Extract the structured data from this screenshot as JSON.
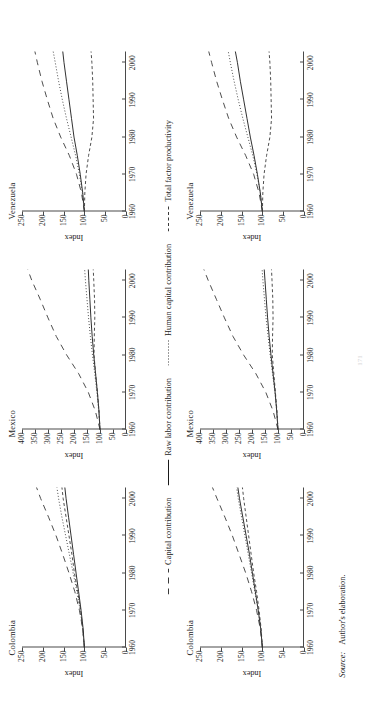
{
  "figure": {
    "ylabel": "Index",
    "source_label": "Source:",
    "source_text": "Author's elaboration.",
    "folio": "171",
    "legend": [
      {
        "label": "Capital contribution",
        "style": "long-dash",
        "color": "#3a3a3a"
      },
      {
        "label": "Raw labor contribution",
        "style": "solid",
        "color": "#1a1a1a"
      },
      {
        "label": "Human capital contribution",
        "style": "dotted",
        "color": "#3a3a3a"
      },
      {
        "label": "Total factor productivity",
        "style": "short-dash",
        "color": "#3a3a3a"
      }
    ]
  },
  "chart_data": [
    {
      "id": "colombia-top",
      "type": "line",
      "title": "Colombia",
      "xlabel": "",
      "ylabel": "Index",
      "xlim": [
        1960,
        2003
      ],
      "ylim": [
        0,
        250
      ],
      "xticks": [
        1960,
        1970,
        1980,
        1990,
        2000
      ],
      "yticks": [
        0,
        50,
        100,
        150,
        200,
        250
      ],
      "grid": false,
      "legend_position": "below-figure",
      "x": [
        1960,
        1965,
        1970,
        1975,
        1980,
        1985,
        1990,
        1995,
        2000,
        2003
      ],
      "series": [
        {
          "name": "Capital contribution",
          "style": "long-dash",
          "values": [
            100,
            104,
            112,
            123,
            137,
            152,
            168,
            186,
            205,
            215
          ]
        },
        {
          "name": "Raw labor contribution",
          "style": "solid",
          "values": [
            100,
            103,
            108,
            114,
            120,
            126,
            132,
            138,
            144,
            147
          ]
        },
        {
          "name": "Human capital contribution",
          "style": "dotted",
          "values": [
            100,
            104,
            110,
            118,
            127,
            136,
            145,
            154,
            162,
            166
          ]
        },
        {
          "name": "Total factor productivity",
          "style": "short-dash",
          "values": [
            100,
            104,
            109,
            116,
            124,
            130,
            137,
            144,
            151,
            154
          ]
        }
      ]
    },
    {
      "id": "mexico-top",
      "type": "line",
      "title": "Mexico",
      "xlabel": "",
      "ylabel": "Index",
      "xlim": [
        1960,
        2003
      ],
      "ylim": [
        0,
        400
      ],
      "xticks": [
        1960,
        1970,
        1980,
        1990,
        2000
      ],
      "yticks": [
        0,
        50,
        100,
        150,
        200,
        250,
        300,
        350,
        400
      ],
      "grid": false,
      "legend_position": "below-figure",
      "x": [
        1960,
        1965,
        1970,
        1975,
        1980,
        1985,
        1990,
        1995,
        2000,
        2003
      ],
      "series": [
        {
          "name": "Capital contribution",
          "style": "long-dash",
          "values": [
            100,
            118,
            145,
            182,
            228,
            268,
            300,
            330,
            362,
            378
          ]
        },
        {
          "name": "Raw labor contribution",
          "style": "solid",
          "values": [
            100,
            104,
            110,
            117,
            124,
            130,
            135,
            139,
            143,
            145
          ]
        },
        {
          "name": "Human capital contribution",
          "style": "dotted",
          "values": [
            100,
            105,
            112,
            120,
            129,
            137,
            144,
            150,
            156,
            159
          ]
        },
        {
          "name": "Total factor productivity",
          "style": "short-dash",
          "values": [
            100,
            104,
            110,
            117,
            123,
            122,
            120,
            121,
            124,
            126
          ]
        }
      ]
    },
    {
      "id": "venezuela-top",
      "type": "line",
      "title": "Venezuela",
      "xlabel": "",
      "ylabel": "Index",
      "xlim": [
        1960,
        2003
      ],
      "ylim": [
        0,
        250
      ],
      "xticks": [
        1960,
        1970,
        1980,
        1990,
        2000
      ],
      "yticks": [
        0,
        50,
        100,
        150,
        200,
        250
      ],
      "grid": false,
      "legend_position": "below-figure",
      "x": [
        1960,
        1965,
        1970,
        1975,
        1980,
        1985,
        1990,
        1995,
        2000,
        2003
      ],
      "series": [
        {
          "name": "Capital contribution",
          "style": "long-dash",
          "values": [
            100,
            107,
            119,
            136,
            157,
            175,
            189,
            202,
            213,
            219
          ]
        },
        {
          "name": "Raw labor contribution",
          "style": "solid",
          "values": [
            100,
            104,
            110,
            117,
            125,
            131,
            137,
            143,
            149,
            152
          ]
        },
        {
          "name": "Human capital contribution",
          "style": "dotted",
          "values": [
            100,
            105,
            112,
            121,
            132,
            143,
            153,
            162,
            170,
            175
          ]
        },
        {
          "name": "Total factor productivity",
          "style": "short-dash",
          "values": [
            100,
            99,
            96,
            90,
            82,
            78,
            79,
            80,
            82,
            84
          ]
        }
      ]
    },
    {
      "id": "colombia-bottom",
      "type": "line",
      "title": "Colombia",
      "xlabel": "",
      "ylabel": "Index",
      "xlim": [
        1960,
        2003
      ],
      "ylim": [
        0,
        250
      ],
      "xticks": [
        1960,
        1970,
        1980,
        1990,
        2000
      ],
      "yticks": [
        0,
        50,
        100,
        150,
        200,
        250
      ],
      "grid": false,
      "legend_position": "above-figure",
      "x": [
        1960,
        1965,
        1970,
        1975,
        1980,
        1985,
        1990,
        1995,
        2000,
        2003
      ],
      "series": [
        {
          "name": "Capital contribution",
          "style": "long-dash",
          "values": [
            100,
            105,
            114,
            126,
            140,
            156,
            172,
            190,
            209,
            220
          ]
        },
        {
          "name": "Raw labor contribution",
          "style": "solid",
          "values": [
            100,
            104,
            110,
            117,
            124,
            131,
            139,
            147,
            155,
            159
          ]
        },
        {
          "name": "Human capital contribution",
          "style": "dotted",
          "values": [
            100,
            104,
            110,
            118,
            126,
            134,
            142,
            150,
            158,
            162
          ]
        },
        {
          "name": "Total factor productivity",
          "style": "short-dash",
          "values": [
            100,
            103,
            108,
            114,
            121,
            127,
            133,
            139,
            145,
            148
          ]
        }
      ]
    },
    {
      "id": "mexico-bottom",
      "type": "line",
      "title": "Mexico",
      "xlabel": "",
      "ylabel": "Index",
      "xlim": [
        1960,
        2003
      ],
      "ylim": [
        0,
        400
      ],
      "xticks": [
        1960,
        1970,
        1980,
        1990,
        2000
      ],
      "yticks": [
        0,
        50,
        100,
        150,
        200,
        250,
        300,
        350,
        400
      ],
      "grid": false,
      "legend_position": "above-figure",
      "x": [
        1960,
        1965,
        1970,
        1975,
        1980,
        1985,
        1990,
        1995,
        2000,
        2003
      ],
      "series": [
        {
          "name": "Capital contribution",
          "style": "long-dash",
          "values": [
            100,
            119,
            147,
            185,
            232,
            273,
            306,
            337,
            368,
            385
          ]
        },
        {
          "name": "Raw labor contribution",
          "style": "solid",
          "values": [
            100,
            105,
            111,
            119,
            127,
            134,
            140,
            145,
            150,
            153
          ]
        },
        {
          "name": "Human capital contribution",
          "style": "dotted",
          "values": [
            100,
            105,
            112,
            121,
            130,
            138,
            146,
            152,
            158,
            161
          ]
        },
        {
          "name": "Total factor productivity",
          "style": "short-dash",
          "values": [
            100,
            104,
            110,
            116,
            122,
            121,
            119,
            120,
            123,
            125
          ]
        }
      ]
    },
    {
      "id": "venezuela-bottom",
      "type": "line",
      "title": "Venezuela",
      "xlabel": "",
      "ylabel": "Index",
      "xlim": [
        1960,
        2003
      ],
      "ylim": [
        0,
        250
      ],
      "xticks": [
        1960,
        1970,
        1980,
        1990,
        2000
      ],
      "yticks": [
        0,
        50,
        100,
        150,
        200,
        250
      ],
      "grid": false,
      "legend_position": "above-figure",
      "x": [
        1960,
        1965,
        1970,
        1975,
        1980,
        1985,
        1990,
        1995,
        2000,
        2003
      ],
      "series": [
        {
          "name": "Capital contribution",
          "style": "long-dash",
          "values": [
            100,
            108,
            121,
            140,
            162,
            181,
            196,
            210,
            222,
            229
          ]
        },
        {
          "name": "Raw labor contribution",
          "style": "solid",
          "values": [
            100,
            105,
            112,
            120,
            129,
            137,
            145,
            153,
            160,
            165
          ]
        },
        {
          "name": "Human capital contribution",
          "style": "dotted",
          "values": [
            100,
            105,
            113,
            123,
            135,
            147,
            158,
            168,
            177,
            182
          ]
        },
        {
          "name": "Total factor productivity",
          "style": "short-dash",
          "values": [
            100,
            99,
            96,
            90,
            82,
            78,
            79,
            80,
            82,
            84
          ]
        }
      ]
    }
  ]
}
